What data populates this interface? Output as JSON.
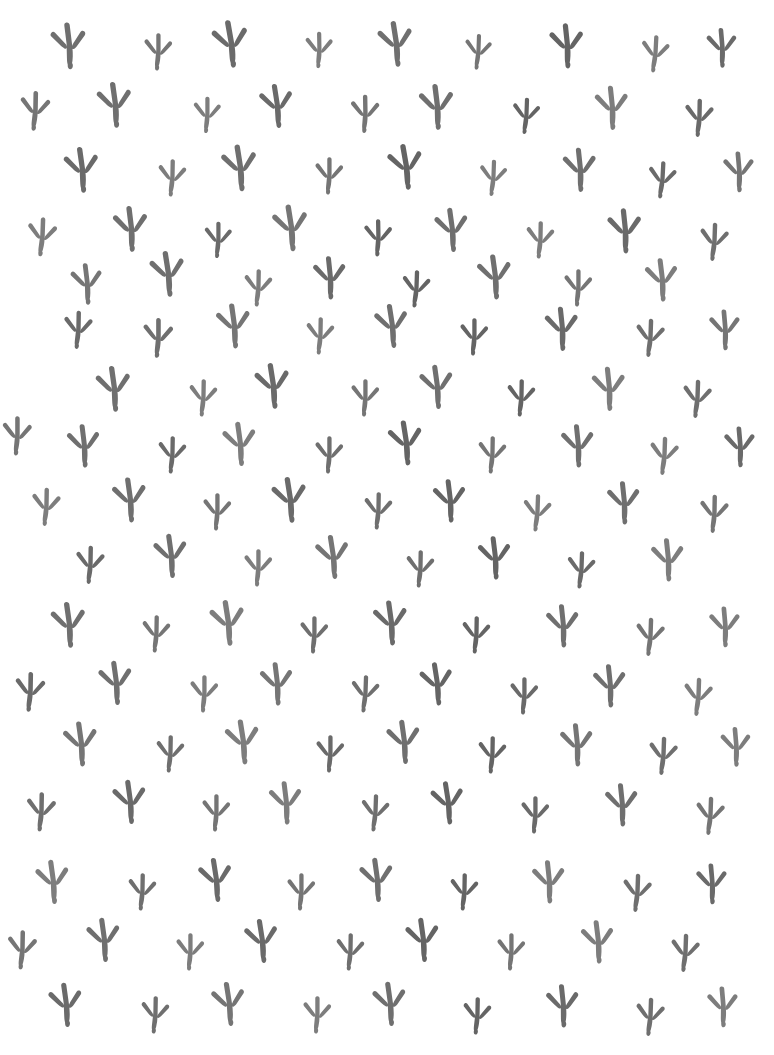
{
  "artwork": {
    "title": "Bird Track Pattern",
    "description": "Seamless decorative pattern of three-toed bird footprints",
    "motif_name": "bird-footprint",
    "motif_direction": "down",
    "background_color": "#ffffff",
    "motif_color": "#6f6f6f",
    "canvas": {
      "width": 774,
      "height": 1055
    },
    "layout": {
      "type": "staggered-grid",
      "rows": 18,
      "row_spacing": 60,
      "column_spacing": 85,
      "stagger_offset": 42
    },
    "ink_shades": [
      "#6f6f6f",
      "#757575",
      "#6a6a6a",
      "#7d7d7d",
      "#646464"
    ]
  },
  "motifs": [
    {
      "x": 69,
      "y": 46,
      "s": 1.08,
      "r": -4,
      "ink": ""
    },
    {
      "x": 158,
      "y": 52,
      "s": 0.86,
      "r": 3,
      "ink": "ink-a"
    },
    {
      "x": 231,
      "y": 44,
      "s": 1.1,
      "r": -7,
      "ink": "ink-b"
    },
    {
      "x": 319,
      "y": 50,
      "s": 0.84,
      "r": 2,
      "ink": "ink-c"
    },
    {
      "x": 396,
      "y": 44,
      "s": 1.06,
      "r": -6,
      "ink": ""
    },
    {
      "x": 478,
      "y": 52,
      "s": 0.82,
      "r": 5,
      "ink": "ink-a"
    },
    {
      "x": 567,
      "y": 46,
      "s": 1.04,
      "r": -3,
      "ink": "ink-d"
    },
    {
      "x": 655,
      "y": 54,
      "s": 0.86,
      "r": 6,
      "ink": "ink-c"
    },
    {
      "x": 722,
      "y": 48,
      "s": 0.92,
      "r": -2,
      "ink": "ink-b"
    },
    {
      "x": 35,
      "y": 111,
      "s": 0.92,
      "r": 4,
      "ink": "ink-a"
    },
    {
      "x": 115,
      "y": 105,
      "s": 1.06,
      "r": -5,
      "ink": ""
    },
    {
      "x": 207,
      "y": 115,
      "s": 0.84,
      "r": 3,
      "ink": "ink-c"
    },
    {
      "x": 277,
      "y": 106,
      "s": 1.02,
      "r": -6,
      "ink": "ink-b"
    },
    {
      "x": 365,
      "y": 114,
      "s": 0.88,
      "r": 2,
      "ink": "ink-a"
    },
    {
      "x": 437,
      "y": 107,
      "s": 1.06,
      "r": -4,
      "ink": ""
    },
    {
      "x": 526,
      "y": 116,
      "s": 0.84,
      "r": 5,
      "ink": "ink-d"
    },
    {
      "x": 612,
      "y": 108,
      "s": 1.02,
      "r": -3,
      "ink": "ink-c"
    },
    {
      "x": 699,
      "y": 118,
      "s": 0.88,
      "r": 4,
      "ink": "ink-b"
    },
    {
      "x": 82,
      "y": 170,
      "s": 1.06,
      "r": -5,
      "ink": "ink-b"
    },
    {
      "x": 172,
      "y": 178,
      "s": 0.86,
      "r": 4,
      "ink": "ink-c"
    },
    {
      "x": 240,
      "y": 168,
      "s": 1.08,
      "r": -6,
      "ink": ""
    },
    {
      "x": 329,
      "y": 176,
      "s": 0.86,
      "r": 3,
      "ink": "ink-a"
    },
    {
      "x": 406,
      "y": 167,
      "s": 1.06,
      "r": -7,
      "ink": "ink-d"
    },
    {
      "x": 493,
      "y": 178,
      "s": 0.84,
      "r": 5,
      "ink": "ink-c"
    },
    {
      "x": 580,
      "y": 170,
      "s": 1.02,
      "r": -3,
      "ink": ""
    },
    {
      "x": 662,
      "y": 180,
      "s": 0.86,
      "r": 6,
      "ink": "ink-b"
    },
    {
      "x": 739,
      "y": 172,
      "s": 0.94,
      "r": -2,
      "ink": "ink-a"
    },
    {
      "x": 42,
      "y": 237,
      "s": 0.9,
      "r": 5,
      "ink": "ink-c"
    },
    {
      "x": 131,
      "y": 229,
      "s": 1.06,
      "r": -4,
      "ink": ""
    },
    {
      "x": 218,
      "y": 240,
      "s": 0.84,
      "r": 3,
      "ink": "ink-b"
    },
    {
      "x": 291,
      "y": 228,
      "s": 1.08,
      "r": -6,
      "ink": "ink-a"
    },
    {
      "x": 378,
      "y": 238,
      "s": 0.86,
      "r": 2,
      "ink": "ink-d"
    },
    {
      "x": 452,
      "y": 230,
      "s": 1.02,
      "r": -5,
      "ink": ""
    },
    {
      "x": 540,
      "y": 240,
      "s": 0.86,
      "r": 4,
      "ink": "ink-c"
    },
    {
      "x": 625,
      "y": 231,
      "s": 1.04,
      "r": -3,
      "ink": "ink-b"
    },
    {
      "x": 714,
      "y": 242,
      "s": 0.88,
      "r": 5,
      "ink": ""
    },
    {
      "x": 87,
      "y": 284,
      "s": 0.96,
      "r": -4,
      "ink": "ink-a"
    },
    {
      "x": 168,
      "y": 274,
      "s": 1.06,
      "r": -6,
      "ink": ""
    },
    {
      "x": 258,
      "y": 288,
      "s": 0.86,
      "r": 4,
      "ink": "ink-c"
    },
    {
      "x": 330,
      "y": 278,
      "s": 1.0,
      "r": -3,
      "ink": "ink-b"
    },
    {
      "x": 416,
      "y": 289,
      "s": 0.86,
      "r": 5,
      "ink": "ink-d"
    },
    {
      "x": 495,
      "y": 277,
      "s": 1.04,
      "r": -5,
      "ink": ""
    },
    {
      "x": 578,
      "y": 288,
      "s": 0.86,
      "r": 3,
      "ink": "ink-a"
    },
    {
      "x": 662,
      "y": 280,
      "s": 1.0,
      "r": -4,
      "ink": "ink-c"
    },
    {
      "x": 78,
      "y": 330,
      "s": 0.88,
      "r": 4,
      "ink": "ink-b"
    },
    {
      "x": 158,
      "y": 338,
      "s": 0.92,
      "r": 3,
      "ink": ""
    },
    {
      "x": 234,
      "y": 326,
      "s": 1.04,
      "r": -5,
      "ink": "ink-a"
    },
    {
      "x": 320,
      "y": 336,
      "s": 0.86,
      "r": 4,
      "ink": "ink-c"
    },
    {
      "x": 392,
      "y": 326,
      "s": 1.02,
      "r": -6,
      "ink": ""
    },
    {
      "x": 474,
      "y": 337,
      "s": 0.86,
      "r": 3,
      "ink": "ink-d"
    },
    {
      "x": 562,
      "y": 329,
      "s": 1.02,
      "r": -3,
      "ink": "ink-b"
    },
    {
      "x": 650,
      "y": 338,
      "s": 0.88,
      "r": 5,
      "ink": ""
    },
    {
      "x": 725,
      "y": 330,
      "s": 0.94,
      "r": -2,
      "ink": "ink-a"
    },
    {
      "x": 114,
      "y": 389,
      "s": 1.06,
      "r": -5,
      "ink": ""
    },
    {
      "x": 203,
      "y": 398,
      "s": 0.86,
      "r": 4,
      "ink": "ink-c"
    },
    {
      "x": 273,
      "y": 386,
      "s": 1.06,
      "r": -6,
      "ink": "ink-b"
    },
    {
      "x": 365,
      "y": 398,
      "s": 0.86,
      "r": 3,
      "ink": "ink-a"
    },
    {
      "x": 437,
      "y": 387,
      "s": 1.02,
      "r": -5,
      "ink": ""
    },
    {
      "x": 521,
      "y": 398,
      "s": 0.86,
      "r": 4,
      "ink": "ink-d"
    },
    {
      "x": 609,
      "y": 389,
      "s": 1.02,
      "r": -3,
      "ink": "ink-c"
    },
    {
      "x": 697,
      "y": 399,
      "s": 0.88,
      "r": 5,
      "ink": ""
    },
    {
      "x": 17,
      "y": 436,
      "s": 0.9,
      "r": 3,
      "ink": "ink-a"
    },
    {
      "x": 84,
      "y": 446,
      "s": 1.0,
      "r": -4,
      "ink": ""
    },
    {
      "x": 172,
      "y": 455,
      "s": 0.86,
      "r": 4,
      "ink": "ink-b"
    },
    {
      "x": 240,
      "y": 444,
      "s": 1.02,
      "r": -5,
      "ink": "ink-c"
    },
    {
      "x": 329,
      "y": 455,
      "s": 0.86,
      "r": 3,
      "ink": ""
    },
    {
      "x": 406,
      "y": 443,
      "s": 1.04,
      "r": -6,
      "ink": "ink-d"
    },
    {
      "x": 492,
      "y": 455,
      "s": 0.86,
      "r": 4,
      "ink": "ink-a"
    },
    {
      "x": 578,
      "y": 446,
      "s": 1.0,
      "r": -3,
      "ink": ""
    },
    {
      "x": 664,
      "y": 456,
      "s": 0.88,
      "r": 5,
      "ink": "ink-c"
    },
    {
      "x": 740,
      "y": 447,
      "s": 0.94,
      "r": -2,
      "ink": "ink-b"
    },
    {
      "x": 46,
      "y": 507,
      "s": 0.88,
      "r": 4,
      "ink": "ink-c"
    },
    {
      "x": 130,
      "y": 500,
      "s": 1.04,
      "r": -5,
      "ink": ""
    },
    {
      "x": 217,
      "y": 512,
      "s": 0.86,
      "r": 3,
      "ink": "ink-a"
    },
    {
      "x": 290,
      "y": 500,
      "s": 1.06,
      "r": -6,
      "ink": "ink-b"
    },
    {
      "x": 378,
      "y": 511,
      "s": 0.86,
      "r": 4,
      "ink": ""
    },
    {
      "x": 450,
      "y": 501,
      "s": 1.0,
      "r": -4,
      "ink": "ink-d"
    },
    {
      "x": 537,
      "y": 513,
      "s": 0.86,
      "r": 5,
      "ink": "ink-c"
    },
    {
      "x": 624,
      "y": 503,
      "s": 1.0,
      "r": -3,
      "ink": ""
    },
    {
      "x": 714,
      "y": 514,
      "s": 0.88,
      "r": 4,
      "ink": "ink-a"
    },
    {
      "x": 90,
      "y": 565,
      "s": 0.88,
      "r": 4,
      "ink": "ink-b"
    },
    {
      "x": 171,
      "y": 556,
      "s": 1.02,
      "r": -5,
      "ink": ""
    },
    {
      "x": 258,
      "y": 568,
      "s": 0.86,
      "r": 3,
      "ink": "ink-c"
    },
    {
      "x": 333,
      "y": 557,
      "s": 1.02,
      "r": -6,
      "ink": "ink-a"
    },
    {
      "x": 420,
      "y": 569,
      "s": 0.86,
      "r": 4,
      "ink": ""
    },
    {
      "x": 495,
      "y": 558,
      "s": 1.0,
      "r": -4,
      "ink": "ink-d"
    },
    {
      "x": 581,
      "y": 570,
      "s": 0.86,
      "r": 5,
      "ink": "ink-b"
    },
    {
      "x": 668,
      "y": 560,
      "s": 1.0,
      "r": -3,
      "ink": "ink-c"
    },
    {
      "x": 69,
      "y": 625,
      "s": 1.06,
      "r": -5,
      "ink": ""
    },
    {
      "x": 156,
      "y": 634,
      "s": 0.86,
      "r": 4,
      "ink": "ink-a"
    },
    {
      "x": 228,
      "y": 623,
      "s": 1.06,
      "r": -6,
      "ink": "ink-c"
    },
    {
      "x": 314,
      "y": 635,
      "s": 0.86,
      "r": 3,
      "ink": ""
    },
    {
      "x": 391,
      "y": 623,
      "s": 1.04,
      "r": -5,
      "ink": "ink-b"
    },
    {
      "x": 476,
      "y": 635,
      "s": 0.86,
      "r": 4,
      "ink": "ink-d"
    },
    {
      "x": 563,
      "y": 626,
      "s": 1.0,
      "r": -3,
      "ink": ""
    },
    {
      "x": 650,
      "y": 637,
      "s": 0.88,
      "r": 5,
      "ink": "ink-a"
    },
    {
      "x": 725,
      "y": 627,
      "s": 0.94,
      "r": -2,
      "ink": "ink-c"
    },
    {
      "x": 30,
      "y": 692,
      "s": 0.92,
      "r": 4,
      "ink": "ink-b"
    },
    {
      "x": 116,
      "y": 683,
      "s": 1.02,
      "r": -5,
      "ink": ""
    },
    {
      "x": 204,
      "y": 694,
      "s": 0.86,
      "r": 3,
      "ink": "ink-c"
    },
    {
      "x": 277,
      "y": 684,
      "s": 1.0,
      "r": -4,
      "ink": "ink-a"
    },
    {
      "x": 365,
      "y": 694,
      "s": 0.86,
      "r": 5,
      "ink": ""
    },
    {
      "x": 437,
      "y": 684,
      "s": 1.0,
      "r": -6,
      "ink": "ink-d"
    },
    {
      "x": 524,
      "y": 696,
      "s": 0.86,
      "r": 3,
      "ink": "ink-b"
    },
    {
      "x": 610,
      "y": 686,
      "s": 1.0,
      "r": -3,
      "ink": ""
    },
    {
      "x": 698,
      "y": 697,
      "s": 0.88,
      "r": 5,
      "ink": "ink-c"
    },
    {
      "x": 81,
      "y": 744,
      "s": 1.04,
      "r": -5,
      "ink": "ink-a"
    },
    {
      "x": 170,
      "y": 754,
      "s": 0.86,
      "r": 4,
      "ink": ""
    },
    {
      "x": 243,
      "y": 742,
      "s": 1.04,
      "r": -6,
      "ink": "ink-c"
    },
    {
      "x": 330,
      "y": 754,
      "s": 0.86,
      "r": 3,
      "ink": "ink-b"
    },
    {
      "x": 404,
      "y": 742,
      "s": 1.02,
      "r": -5,
      "ink": ""
    },
    {
      "x": 492,
      "y": 755,
      "s": 0.86,
      "r": 4,
      "ink": "ink-d"
    },
    {
      "x": 577,
      "y": 745,
      "s": 1.0,
      "r": -3,
      "ink": "ink-a"
    },
    {
      "x": 663,
      "y": 756,
      "s": 0.88,
      "r": 5,
      "ink": ""
    },
    {
      "x": 736,
      "y": 747,
      "s": 0.92,
      "r": -2,
      "ink": "ink-c"
    },
    {
      "x": 41,
      "y": 812,
      "s": 0.9,
      "r": 4,
      "ink": ""
    },
    {
      "x": 130,
      "y": 802,
      "s": 1.02,
      "r": -5,
      "ink": "ink-b"
    },
    {
      "x": 216,
      "y": 813,
      "s": 0.86,
      "r": 3,
      "ink": "ink-a"
    },
    {
      "x": 286,
      "y": 803,
      "s": 1.0,
      "r": -4,
      "ink": "ink-c"
    },
    {
      "x": 375,
      "y": 813,
      "s": 0.86,
      "r": 5,
      "ink": ""
    },
    {
      "x": 448,
      "y": 803,
      "s": 1.0,
      "r": -6,
      "ink": "ink-d"
    },
    {
      "x": 535,
      "y": 815,
      "s": 0.86,
      "r": 3,
      "ink": "ink-b"
    },
    {
      "x": 622,
      "y": 805,
      "s": 1.0,
      "r": -3,
      "ink": ""
    },
    {
      "x": 710,
      "y": 816,
      "s": 0.88,
      "r": 5,
      "ink": "ink-a"
    },
    {
      "x": 53,
      "y": 882,
      "s": 1.02,
      "r": -5,
      "ink": "ink-c"
    },
    {
      "x": 142,
      "y": 892,
      "s": 0.86,
      "r": 4,
      "ink": ""
    },
    {
      "x": 216,
      "y": 880,
      "s": 1.02,
      "r": -6,
      "ink": "ink-b"
    },
    {
      "x": 301,
      "y": 892,
      "s": 0.86,
      "r": 3,
      "ink": "ink-a"
    },
    {
      "x": 377,
      "y": 880,
      "s": 1.02,
      "r": -5,
      "ink": ""
    },
    {
      "x": 464,
      "y": 892,
      "s": 0.86,
      "r": 4,
      "ink": "ink-d"
    },
    {
      "x": 549,
      "y": 882,
      "s": 1.0,
      "r": -3,
      "ink": "ink-c"
    },
    {
      "x": 637,
      "y": 893,
      "s": 0.88,
      "r": 5,
      "ink": ""
    },
    {
      "x": 712,
      "y": 884,
      "s": 0.94,
      "r": -2,
      "ink": "ink-b"
    },
    {
      "x": 22,
      "y": 950,
      "s": 0.9,
      "r": 4,
      "ink": "ink-a"
    },
    {
      "x": 104,
      "y": 940,
      "s": 1.02,
      "r": -5,
      "ink": ""
    },
    {
      "x": 190,
      "y": 952,
      "s": 0.86,
      "r": 3,
      "ink": "ink-c"
    },
    {
      "x": 262,
      "y": 941,
      "s": 1.02,
      "r": -6,
      "ink": "ink-b"
    },
    {
      "x": 350,
      "y": 952,
      "s": 0.86,
      "r": 4,
      "ink": ""
    },
    {
      "x": 423,
      "y": 940,
      "s": 1.02,
      "r": -5,
      "ink": "ink-d"
    },
    {
      "x": 511,
      "y": 952,
      "s": 0.86,
      "r": 3,
      "ink": "ink-a"
    },
    {
      "x": 598,
      "y": 942,
      "s": 1.0,
      "r": -4,
      "ink": "ink-c"
    },
    {
      "x": 685,
      "y": 953,
      "s": 0.88,
      "r": 5,
      "ink": ""
    },
    {
      "x": 66,
      "y": 1005,
      "s": 1.02,
      "r": -5,
      "ink": "ink-b"
    },
    {
      "x": 155,
      "y": 1015,
      "s": 0.86,
      "r": 4,
      "ink": ""
    },
    {
      "x": 229,
      "y": 1004,
      "s": 1.02,
      "r": -6,
      "ink": "ink-a"
    },
    {
      "x": 317,
      "y": 1015,
      "s": 0.86,
      "r": 3,
      "ink": "ink-c"
    },
    {
      "x": 390,
      "y": 1004,
      "s": 1.02,
      "r": -5,
      "ink": ""
    },
    {
      "x": 477,
      "y": 1016,
      "s": 0.86,
      "r": 4,
      "ink": "ink-d"
    },
    {
      "x": 563,
      "y": 1006,
      "s": 1.0,
      "r": -3,
      "ink": "ink-b"
    },
    {
      "x": 650,
      "y": 1017,
      "s": 0.88,
      "r": 5,
      "ink": ""
    },
    {
      "x": 723,
      "y": 1007,
      "s": 0.94,
      "r": -2,
      "ink": "ink-c"
    }
  ]
}
